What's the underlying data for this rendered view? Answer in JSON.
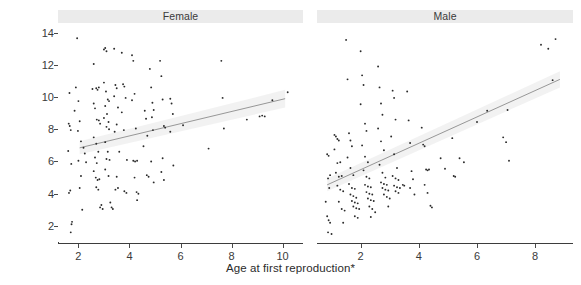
{
  "figure": {
    "width": 581,
    "height": 285,
    "background": "#ffffff",
    "point_color": "#2a2a2a",
    "line_color": "#8c8c8c",
    "band_color": "#d9d9d9",
    "strip_color": "#ebebeb",
    "axis_color": "#3d3d3d"
  },
  "axes": {
    "xlabel": "Age at first reproduction*",
    "ylabel": "Realized lifespan"
  },
  "chart_data": {
    "type": "scatter",
    "title": "",
    "xlabel": "Age at first reproduction*",
    "ylabel": "Realized lifespan",
    "grid": false,
    "legend": "none",
    "layout": "two panels side by side, faceted by sex",
    "panels": [
      {
        "label": "Female",
        "xlim": [
          1.2,
          10.8
        ],
        "ylim": [
          1.0,
          14.6
        ],
        "xticks": [
          2,
          4,
          6,
          8,
          10
        ],
        "yticks": [
          2,
          4,
          6,
          8,
          10,
          12,
          14
        ],
        "regression": {
          "x": [
            2.05,
            10.1
          ],
          "y": [
            6.85,
            9.9
          ],
          "band_upper": [
            7.25,
            10.45
          ],
          "band_lower": [
            6.45,
            9.35
          ]
        },
        "points": [
          [
            1.65,
            10.25
          ],
          [
            1.62,
            8.35
          ],
          [
            1.66,
            8.2
          ],
          [
            1.7,
            7.95
          ],
          [
            1.6,
            6.65
          ],
          [
            1.72,
            5.85
          ],
          [
            1.68,
            4.2
          ],
          [
            1.63,
            4.05
          ],
          [
            1.75,
            2.25
          ],
          [
            1.73,
            2.1
          ],
          [
            1.7,
            1.6
          ],
          [
            1.95,
            13.65
          ],
          [
            1.9,
            10.6
          ],
          [
            1.85,
            9.15
          ],
          [
            2.0,
            9.75
          ],
          [
            2.05,
            8.5
          ],
          [
            1.98,
            7.9
          ],
          [
            2.1,
            7.25
          ],
          [
            2.0,
            6.05
          ],
          [
            2.1,
            5.1
          ],
          [
            2.05,
            4.35
          ],
          [
            2.15,
            3.0
          ],
          [
            2.2,
            6.85
          ],
          [
            2.25,
            6.5
          ],
          [
            2.3,
            5.95
          ],
          [
            2.6,
            12.05
          ],
          [
            2.55,
            10.5
          ],
          [
            2.7,
            10.55
          ],
          [
            2.75,
            10.45
          ],
          [
            2.8,
            10.6
          ],
          [
            2.6,
            9.6
          ],
          [
            2.65,
            9.3
          ],
          [
            2.72,
            8.6
          ],
          [
            2.8,
            8.55
          ],
          [
            2.85,
            8.35
          ],
          [
            2.6,
            7.5
          ],
          [
            2.7,
            7.1
          ],
          [
            2.78,
            6.6
          ],
          [
            2.65,
            6.25
          ],
          [
            2.72,
            5.9
          ],
          [
            2.6,
            5.4
          ],
          [
            2.68,
            5.0
          ],
          [
            2.75,
            4.85
          ],
          [
            2.82,
            4.9
          ],
          [
            2.7,
            4.4
          ],
          [
            2.78,
            4.25
          ],
          [
            2.9,
            3.3
          ],
          [
            2.85,
            3.15
          ],
          [
            2.95,
            3.05
          ],
          [
            3.0,
            12.95
          ],
          [
            3.05,
            13.05
          ],
          [
            3.1,
            12.85
          ],
          [
            3.0,
            10.9
          ],
          [
            3.08,
            10.35
          ],
          [
            3.15,
            9.85
          ],
          [
            3.2,
            9.75
          ],
          [
            3.05,
            9.45
          ],
          [
            3.12,
            8.95
          ],
          [
            3.0,
            8.7
          ],
          [
            3.18,
            8.45
          ],
          [
            3.1,
            8.15
          ],
          [
            3.2,
            8.0
          ],
          [
            3.05,
            7.2
          ],
          [
            3.15,
            6.6
          ],
          [
            3.1,
            6.15
          ],
          [
            3.22,
            6.1
          ],
          [
            3.05,
            5.5
          ],
          [
            3.18,
            5.1
          ],
          [
            3.25,
            3.45
          ],
          [
            3.3,
            3.15
          ],
          [
            3.35,
            3.05
          ],
          [
            3.4,
            13.0
          ],
          [
            3.45,
            10.75
          ],
          [
            3.5,
            10.55
          ],
          [
            3.4,
            10.05
          ],
          [
            3.55,
            9.35
          ],
          [
            3.5,
            8.3
          ],
          [
            3.42,
            7.85
          ],
          [
            3.6,
            6.6
          ],
          [
            3.5,
            5.05
          ],
          [
            3.55,
            4.35
          ],
          [
            3.45,
            4.25
          ],
          [
            3.7,
            12.75
          ],
          [
            3.75,
            10.8
          ],
          [
            3.8,
            10.65
          ],
          [
            3.85,
            9.95
          ],
          [
            3.7,
            9.05
          ],
          [
            3.78,
            7.95
          ],
          [
            3.9,
            6.1
          ],
          [
            3.8,
            4.15
          ],
          [
            3.88,
            4.05
          ],
          [
            4.1,
            12.6
          ],
          [
            4.15,
            12.25
          ],
          [
            4.2,
            10.2
          ],
          [
            4.1,
            9.8
          ],
          [
            4.25,
            8.05
          ],
          [
            4.15,
            6.05
          ],
          [
            4.22,
            6.0
          ],
          [
            4.3,
            6.05
          ],
          [
            4.2,
            5.0
          ],
          [
            4.28,
            4.1
          ],
          [
            4.35,
            4.0
          ],
          [
            4.3,
            3.6
          ],
          [
            4.6,
            9.15
          ],
          [
            4.65,
            8.65
          ],
          [
            4.7,
            7.6
          ],
          [
            4.55,
            6.95
          ],
          [
            4.68,
            5.15
          ],
          [
            4.75,
            5.05
          ],
          [
            4.8,
            11.75
          ],
          [
            4.85,
            10.6
          ],
          [
            4.9,
            9.65
          ],
          [
            4.95,
            9.2
          ],
          [
            4.88,
            8.75
          ],
          [
            4.92,
            7.95
          ],
          [
            4.85,
            6.0
          ],
          [
            4.95,
            4.7
          ],
          [
            5.2,
            12.25
          ],
          [
            5.25,
            11.3
          ],
          [
            5.3,
            9.85
          ],
          [
            5.35,
            8.2
          ],
          [
            5.4,
            8.1
          ],
          [
            5.3,
            6.2
          ],
          [
            5.25,
            5.35
          ],
          [
            5.35,
            4.85
          ],
          [
            5.6,
            9.9
          ],
          [
            5.65,
            9.6
          ],
          [
            5.7,
            8.95
          ],
          [
            5.6,
            7.85
          ],
          [
            5.72,
            5.75
          ],
          [
            6.1,
            8.25
          ],
          [
            7.1,
            6.8
          ],
          [
            7.6,
            12.25
          ],
          [
            7.65,
            9.95
          ],
          [
            7.7,
            8.05
          ],
          [
            8.6,
            8.6
          ],
          [
            9.1,
            8.8
          ],
          [
            9.2,
            8.85
          ],
          [
            9.3,
            8.8
          ],
          [
            9.6,
            9.8
          ],
          [
            10.2,
            10.3
          ]
        ]
      },
      {
        "label": "Male",
        "xlim": [
          0.5,
          9.3
        ],
        "ylim": [
          1.0,
          14.6
        ],
        "xticks": [
          2,
          4,
          6,
          8
        ],
        "yticks": [
          2,
          4,
          6,
          8,
          10,
          12,
          14
        ],
        "regression": {
          "x": [
            0.85,
            8.85
          ],
          "y": [
            4.55,
            11.1
          ],
          "band_upper": [
            4.95,
            11.6
          ],
          "band_lower": [
            4.15,
            10.6
          ]
        },
        "points": [
          [
            0.85,
            6.45
          ],
          [
            0.9,
            6.35
          ],
          [
            0.95,
            5.15
          ],
          [
            0.88,
            4.95
          ],
          [
            0.92,
            4.35
          ],
          [
            0.8,
            3.5
          ],
          [
            0.85,
            2.6
          ],
          [
            0.9,
            2.35
          ],
          [
            0.95,
            2.2
          ],
          [
            0.88,
            1.6
          ],
          [
            1.0,
            1.5
          ],
          [
            1.1,
            7.65
          ],
          [
            1.15,
            7.55
          ],
          [
            1.2,
            7.4
          ],
          [
            1.25,
            7.3
          ],
          [
            1.1,
            6.75
          ],
          [
            1.2,
            5.9
          ],
          [
            1.3,
            5.95
          ],
          [
            1.15,
            5.3
          ],
          [
            1.25,
            5.05
          ],
          [
            1.35,
            5.1
          ],
          [
            1.2,
            4.5
          ],
          [
            1.3,
            4.25
          ],
          [
            1.4,
            4.15
          ],
          [
            1.25,
            3.5
          ],
          [
            1.35,
            3.05
          ],
          [
            1.45,
            2.95
          ],
          [
            1.4,
            2.2
          ],
          [
            1.5,
            13.55
          ],
          [
            1.55,
            11.1
          ],
          [
            1.6,
            7.75
          ],
          [
            1.65,
            7.3
          ],
          [
            1.7,
            6.95
          ],
          [
            1.55,
            6.25
          ],
          [
            1.65,
            5.6
          ],
          [
            1.75,
            5.15
          ],
          [
            1.6,
            4.6
          ],
          [
            1.7,
            4.35
          ],
          [
            1.8,
            4.3
          ],
          [
            1.65,
            3.95
          ],
          [
            1.75,
            3.85
          ],
          [
            1.85,
            3.75
          ],
          [
            1.7,
            3.55
          ],
          [
            1.8,
            3.45
          ],
          [
            1.9,
            3.4
          ],
          [
            1.75,
            3.2
          ],
          [
            1.85,
            3.1
          ],
          [
            1.95,
            3.05
          ],
          [
            1.8,
            2.6
          ],
          [
            1.9,
            2.5
          ],
          [
            2.0,
            12.85
          ],
          [
            2.05,
            11.35
          ],
          [
            2.1,
            10.75
          ],
          [
            2.0,
            9.55
          ],
          [
            2.15,
            8.35
          ],
          [
            2.2,
            7.9
          ],
          [
            2.05,
            7.0
          ],
          [
            2.15,
            6.3
          ],
          [
            2.25,
            5.95
          ],
          [
            2.1,
            5.45
          ],
          [
            2.2,
            5.05
          ],
          [
            2.3,
            4.95
          ],
          [
            2.15,
            4.55
          ],
          [
            2.25,
            4.45
          ],
          [
            2.35,
            4.4
          ],
          [
            2.2,
            4.1
          ],
          [
            2.3,
            4.0
          ],
          [
            2.4,
            3.95
          ],
          [
            2.25,
            3.7
          ],
          [
            2.35,
            3.6
          ],
          [
            2.45,
            3.55
          ],
          [
            2.3,
            3.2
          ],
          [
            2.4,
            3.05
          ],
          [
            2.5,
            2.85
          ],
          [
            2.35,
            2.55
          ],
          [
            2.6,
            11.9
          ],
          [
            2.65,
            10.6
          ],
          [
            2.7,
            9.6
          ],
          [
            2.75,
            8.9
          ],
          [
            2.6,
            8.05
          ],
          [
            2.7,
            7.25
          ],
          [
            2.8,
            6.7
          ],
          [
            2.65,
            5.8
          ],
          [
            2.75,
            5.3
          ],
          [
            2.85,
            5.0
          ],
          [
            2.7,
            4.7
          ],
          [
            2.8,
            4.6
          ],
          [
            2.9,
            4.55
          ],
          [
            2.75,
            4.35
          ],
          [
            2.85,
            4.25
          ],
          [
            2.95,
            4.2
          ],
          [
            2.8,
            3.95
          ],
          [
            2.9,
            3.8
          ],
          [
            3.0,
            3.7
          ],
          [
            2.95,
            3.2
          ],
          [
            3.1,
            10.4
          ],
          [
            3.15,
            9.95
          ],
          [
            3.2,
            8.6
          ],
          [
            3.05,
            7.55
          ],
          [
            3.15,
            6.45
          ],
          [
            3.25,
            5.6
          ],
          [
            3.1,
            5.1
          ],
          [
            3.2,
            4.95
          ],
          [
            3.3,
            4.85
          ],
          [
            3.15,
            4.5
          ],
          [
            3.25,
            4.4
          ],
          [
            3.35,
            4.35
          ],
          [
            3.2,
            4.15
          ],
          [
            3.3,
            4.05
          ],
          [
            3.45,
            4.55
          ],
          [
            3.5,
            4.5
          ],
          [
            3.6,
            10.35
          ],
          [
            3.65,
            8.55
          ],
          [
            3.7,
            7.15
          ],
          [
            3.75,
            5.4
          ],
          [
            3.8,
            4.9
          ],
          [
            3.7,
            4.35
          ],
          [
            3.85,
            3.95
          ],
          [
            4.1,
            8.1
          ],
          [
            4.15,
            7.05
          ],
          [
            4.2,
            6.95
          ],
          [
            4.25,
            5.5
          ],
          [
            4.3,
            5.45
          ],
          [
            4.35,
            5.5
          ],
          [
            4.2,
            4.55
          ],
          [
            4.3,
            4.05
          ],
          [
            4.4,
            3.25
          ],
          [
            4.45,
            3.15
          ],
          [
            4.75,
            6.2
          ],
          [
            4.9,
            5.55
          ],
          [
            5.15,
            7.45
          ],
          [
            5.2,
            5.1
          ],
          [
            5.25,
            5.05
          ],
          [
            5.4,
            6.2
          ],
          [
            5.55,
            5.95
          ],
          [
            6.0,
            8.45
          ],
          [
            6.35,
            9.15
          ],
          [
            6.9,
            7.5
          ],
          [
            7.0,
            7.2
          ],
          [
            7.05,
            9.2
          ],
          [
            7.1,
            6.05
          ],
          [
            8.45,
            13.0
          ],
          [
            8.6,
            11.05
          ],
          [
            8.7,
            13.6
          ],
          [
            8.2,
            13.25
          ]
        ]
      }
    ]
  },
  "panel_geometry": {
    "female": {
      "left": 58,
      "width": 245
    },
    "male": {
      "left": 317,
      "width": 256
    }
  }
}
